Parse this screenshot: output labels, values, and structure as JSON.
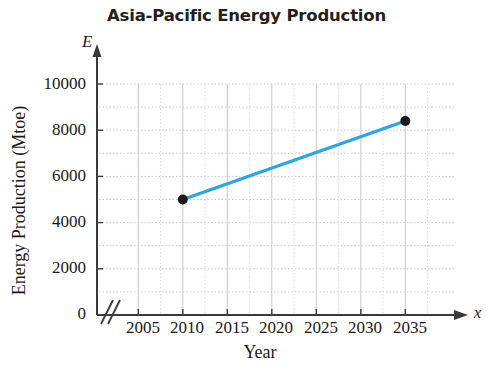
{
  "title": "Asia-Pacific Energy Production",
  "axis_symbols": {
    "y_symbol": "E",
    "x_symbol": "x"
  },
  "chart_data": {
    "type": "line",
    "title": "Asia-Pacific Energy Production",
    "xlabel": "Year",
    "ylabel": "Energy Production (Mtoe)",
    "x": [
      2010,
      2035
    ],
    "values": [
      5000,
      8400
    ],
    "series": [
      {
        "name": "Energy Production",
        "x": [
          2010,
          2035
        ],
        "values": [
          5000,
          8400
        ],
        "color": "#2ba6e0",
        "marker": "filled-circle",
        "marker_color": "#1a1a1a"
      }
    ],
    "xlim": [
      2003,
      2038
    ],
    "ylim": [
      0,
      10000
    ],
    "xticks": [
      2005,
      2010,
      2015,
      2020,
      2025,
      2030,
      2035
    ],
    "xtick_labels": [
      "2005",
      "2010",
      "2015",
      "2020",
      "2025",
      "2030",
      "2035"
    ],
    "yticks": [
      0,
      2000,
      4000,
      6000,
      8000,
      10000
    ],
    "ytick_labels": [
      "0",
      "2000",
      "4000",
      "6000",
      "8000",
      "10000"
    ],
    "y_minor_ticks": [
      1000,
      3000,
      5000,
      7000,
      9000
    ],
    "grid": true,
    "grid_style": "dotted-horizontal-solid-vertical",
    "grid_color": "#c9c9c9",
    "legend": "none",
    "axis_break_x": true,
    "axis_arrows": true
  }
}
